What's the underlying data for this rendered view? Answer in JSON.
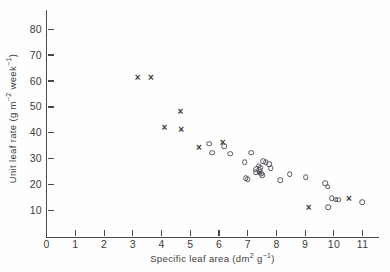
{
  "chart_data": {
    "type": "scatter",
    "title": "",
    "xlabel": "Specific leaf area (dm2 g-1)",
    "ylabel": "Unit leaf rate (g m-2 week-1)",
    "xlabel_parts": {
      "main": "Specific leaf area (dm",
      "sup1": "2",
      "mid": " g",
      "sup2": "−1",
      "tail": ")"
    },
    "ylabel_parts": {
      "main": "Unit leaf rate (g m",
      "sup1": "−2",
      "mid": " week",
      "sup2": "−1",
      "tail": ")"
    },
    "xlim": [
      0,
      11.6
    ],
    "ylim": [
      0,
      83
    ],
    "xticks": [
      0,
      1,
      2,
      3,
      4,
      5,
      6,
      7,
      8,
      9,
      10,
      11
    ],
    "xtick_labels": [
      "0",
      "1",
      "2",
      "3",
      "4",
      "5",
      "6",
      "7",
      "8",
      "9",
      "10",
      "11"
    ],
    "yticks": [
      10,
      20,
      30,
      40,
      50,
      60,
      70,
      80
    ],
    "ytick_labels": [
      "10",
      "20",
      "30",
      "40",
      "50",
      "60",
      "70",
      "80"
    ],
    "grid": false,
    "legend": "none",
    "series": [
      {
        "name": "cross-markers",
        "marker": "cross",
        "points": [
          [
            3.17,
            61.0
          ],
          [
            3.63,
            61.0
          ],
          [
            4.66,
            48.0
          ],
          [
            4.1,
            41.8
          ],
          [
            4.68,
            41.0
          ],
          [
            5.3,
            34.0
          ],
          [
            6.13,
            36.0
          ],
          [
            7.42,
            24.4
          ],
          [
            9.12,
            11.0
          ],
          [
            10.52,
            14.4
          ]
        ]
      },
      {
        "name": "circle-markers",
        "marker": "circle",
        "points": [
          [
            5.66,
            35.8
          ],
          [
            5.77,
            32.4
          ],
          [
            6.18,
            34.8
          ],
          [
            6.38,
            32.0
          ],
          [
            6.9,
            28.6
          ],
          [
            7.12,
            32.3
          ],
          [
            6.93,
            22.6
          ],
          [
            7.0,
            22.2
          ],
          [
            7.3,
            26.0
          ],
          [
            7.38,
            27.4
          ],
          [
            7.4,
            25.6
          ],
          [
            7.28,
            24.9
          ],
          [
            7.46,
            24.2
          ],
          [
            7.5,
            23.6
          ],
          [
            7.44,
            26.6
          ],
          [
            7.54,
            29.0
          ],
          [
            7.62,
            28.6
          ],
          [
            7.74,
            28.0
          ],
          [
            7.8,
            26.4
          ],
          [
            8.12,
            21.8
          ],
          [
            8.46,
            24.0
          ],
          [
            9.02,
            23.0
          ],
          [
            9.7,
            20.6
          ],
          [
            9.78,
            19.2
          ],
          [
            9.8,
            11.4
          ],
          [
            9.92,
            14.8
          ],
          [
            10.06,
            14.2
          ],
          [
            10.14,
            14.2
          ],
          [
            10.98,
            13.2
          ]
        ]
      }
    ]
  }
}
